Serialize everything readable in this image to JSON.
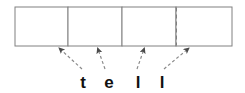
{
  "figure": {
    "type": "tape-diagram",
    "colors": {
      "box_stroke": "#808080",
      "divider_solid": "#808080",
      "divider_dashed": "#808080",
      "arrow": "#808080",
      "text": "#111111",
      "background": "#ffffff"
    },
    "row": {
      "x": 15,
      "y": 7,
      "width": 217,
      "height": 39,
      "stroke_width": 1
    },
    "cells": [
      {
        "id": "cell-1",
        "x": 15,
        "width": 53,
        "label": ""
      },
      {
        "id": "cell-2",
        "x": 68,
        "width": 54,
        "label": ""
      },
      {
        "id": "cell-3",
        "x": 122,
        "width": 54,
        "label": ""
      },
      {
        "id": "cell-4",
        "x": 176,
        "width": 56,
        "label": ""
      }
    ],
    "dividers": [
      {
        "id": "divider-1",
        "x": 68,
        "style": "solid"
      },
      {
        "id": "divider-2",
        "x": 122,
        "style": "solid"
      },
      {
        "id": "divider-3",
        "x": 176,
        "style": "dashed"
      }
    ],
    "letters": [
      {
        "id": "letter-t",
        "char": "t",
        "x": 83,
        "y": 88
      },
      {
        "id": "letter-e",
        "char": "e",
        "x": 109,
        "y": 88
      },
      {
        "id": "letter-l-1",
        "char": "l",
        "x": 138,
        "y": 88
      },
      {
        "id": "letter-l-2",
        "char": "l",
        "x": 162,
        "y": 88
      }
    ],
    "word": "tell",
    "arrows": [
      {
        "id": "arrow-t",
        "from_letter": "t",
        "x1": 82,
        "y1": 69,
        "x2": 58,
        "y2": 47,
        "style": "dashed"
      },
      {
        "id": "arrow-e",
        "from_letter": "e",
        "x1": 105,
        "y1": 69,
        "x2": 97,
        "y2": 47,
        "style": "dashed"
      },
      {
        "id": "arrow-l1",
        "from_letter": "l",
        "x1": 137,
        "y1": 69,
        "x2": 145,
        "y2": 47,
        "style": "dashed"
      },
      {
        "id": "arrow-l2",
        "from_letter": "l",
        "x1": 164,
        "y1": 69,
        "x2": 190,
        "y2": 47,
        "style": "dashed"
      }
    ]
  }
}
